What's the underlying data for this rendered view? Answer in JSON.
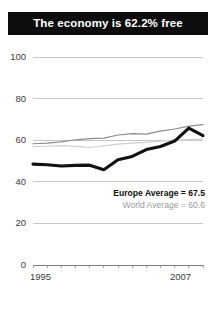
{
  "title": {
    "text": "The economy is 62.2% free",
    "background": "#0d0d0d",
    "color": "#ffffff"
  },
  "legend": {
    "europe": "Europe Average = 67.5",
    "world": "World Average = 60.6"
  },
  "axis": {
    "y_ticks": [
      "100",
      "80",
      "60",
      "40",
      "20",
      "0"
    ],
    "x_start": "1995",
    "x_end": "2007"
  },
  "chart_data": {
    "type": "line",
    "title": "The economy is 62.2% free",
    "xlabel": "",
    "ylabel": "",
    "xlim": [
      1995,
      2007
    ],
    "ylim": [
      0,
      100
    ],
    "grid": true,
    "gridlines_y": [
      0,
      20,
      40,
      60,
      80,
      100
    ],
    "legend_position": "inside-lower-right",
    "x": [
      1995,
      1996,
      1997,
      1998,
      1999,
      2000,
      2001,
      2002,
      2003,
      2004,
      2005,
      2006,
      2007
    ],
    "series": [
      {
        "name": "Country",
        "color": "#111111",
        "width": 3.1,
        "values": [
          48.5,
          48.2,
          47.6,
          47.9,
          48.0,
          45.8,
          50.6,
          52.2,
          55.5,
          57.0,
          59.6,
          65.8,
          62.2
        ]
      },
      {
        "name": "Europe Average = 67.5",
        "color": "#8c8c8c",
        "width": 1.2,
        "values": [
          58.3,
          58.6,
          59.2,
          60.2,
          60.8,
          61.0,
          62.5,
          63.2,
          62.9,
          64.4,
          65.4,
          66.8,
          67.5
        ]
      },
      {
        "name": "World Average = 60.6",
        "color": "#cfcfcf",
        "width": 1.2,
        "values": [
          56.9,
          57.1,
          57.4,
          57.0,
          56.5,
          57.3,
          58.1,
          58.6,
          59.0,
          59.6,
          60.0,
          60.3,
          60.6
        ]
      }
    ],
    "annotations": [
      {
        "text": "Europe Average = 67.5",
        "value": 67.5
      },
      {
        "text": "World Average = 60.6",
        "value": 60.6
      }
    ]
  }
}
